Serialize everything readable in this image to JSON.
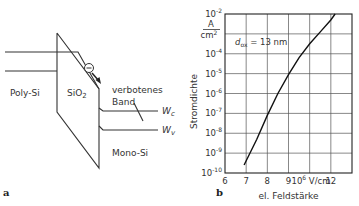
{
  "panel_a": {
    "label": "a",
    "regions": {
      "left": "Poly-Si",
      "oxide": "SiO",
      "oxide_sub": "2",
      "right": "Mono-Si"
    },
    "band_label_1": "verbotenes",
    "band_label_2": "Band",
    "wc": "W",
    "wc_sub": "c",
    "wv": "W",
    "wv_sub": "v",
    "electron_symbol": "−"
  },
  "panel_b": {
    "label": "b",
    "unit_num": "A",
    "unit_den": "cm",
    "unit_den_sup": "2",
    "annotation": "d",
    "annotation_sub": "ox",
    "annotation_value": " = 13 nm",
    "x_unit": "·10",
    "x_unit_sup": "6",
    "x_unit_tail": " V/cm"
  },
  "chart_data": {
    "type": "line",
    "title": "",
    "xlabel": "el. Feldstärke",
    "ylabel": "Stromdichte",
    "x_unit": "10^6 V/cm",
    "y_unit": "A/cm^2",
    "xlim": [
      6,
      12
    ],
    "ylim_log10": [
      -10,
      -2
    ],
    "x_ticks": [
      "6",
      "7",
      "8",
      "9",
      "",
      "12"
    ],
    "y_ticks": [
      "10^-2",
      "",
      "10^-4",
      "10^-5",
      "10^-6",
      "10^-7",
      "10^-8",
      "10^-9",
      "10^-10"
    ],
    "grid": true,
    "annotation": "d_ox = 13 nm",
    "series": [
      {
        "name": "d_ox = 13 nm",
        "x": [
          6.9,
          7.5,
          8.0,
          8.5,
          9.0,
          9.5,
          10.0,
          10.5,
          11.0,
          11.2
        ],
        "log10_y": [
          -9.6,
          -8.3,
          -7.1,
          -6.0,
          -5.05,
          -4.2,
          -3.5,
          -2.9,
          -2.3,
          -2.0
        ]
      }
    ]
  }
}
